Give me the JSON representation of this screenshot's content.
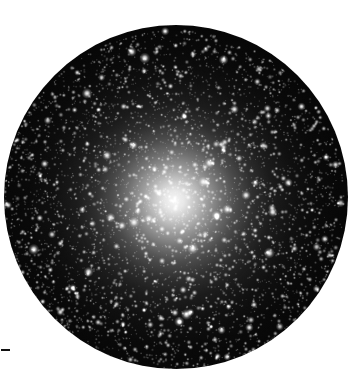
{
  "figure": {
    "kind": "astronomical-photograph",
    "caption": "",
    "background_color": "#ffffff",
    "sky_color": "#050505",
    "star_color": "#ffffff"
  },
  "aperture": {
    "name": "circular telescope field of view",
    "center_x": 176,
    "center_y": 197,
    "radius": 172,
    "shape": "circle"
  },
  "core": {
    "name": "unresolved cluster core",
    "center_x_fraction": 0.495,
    "center_y_fraction": 0.51,
    "peak_gray": "#ffffff",
    "halo_falloff": "radial"
  },
  "scale_bar": {
    "label": "",
    "x": 1,
    "y": 349,
    "width": 9,
    "height": 2,
    "color": "#111111"
  },
  "star_field": {
    "description": "resolved cluster members, dense toward center",
    "counts": {
      "bright_foreground": 150,
      "medium": 900,
      "faint": 3400
    },
    "seed": 20240517
  },
  "chart_data": {
    "type": "scatter",
    "title": "",
    "xlabel": "",
    "ylabel": "",
    "radial_profile": {
      "radius_fraction": [
        0.0,
        0.05,
        0.1,
        0.15,
        0.2,
        0.25,
        0.3,
        0.4,
        0.5,
        0.6,
        0.7,
        0.8,
        0.9,
        1.0
      ],
      "relative_surface_brightness": [
        1.0,
        0.93,
        0.84,
        0.73,
        0.62,
        0.51,
        0.41,
        0.27,
        0.18,
        0.11,
        0.06,
        0.03,
        0.01,
        0.0
      ],
      "relative_star_density": [
        1.0,
        0.95,
        0.87,
        0.77,
        0.66,
        0.56,
        0.46,
        0.32,
        0.22,
        0.15,
        0.1,
        0.06,
        0.03,
        0.01
      ]
    }
  }
}
